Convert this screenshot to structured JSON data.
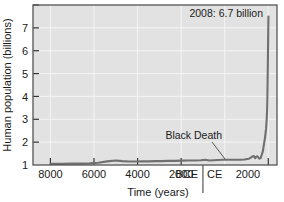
{
  "figure": {
    "background_color": "#ffffff",
    "plot_background_color": "#e2e2e2",
    "plot_border_color": "#555555",
    "gridline_color": "#f2f2f2",
    "line_color": "#707070",
    "text_color": "#1a1a1a"
  },
  "chart_data": {
    "type": "line",
    "title": "",
    "xlabel": "Time (years)",
    "ylabel": "Human population (billions)",
    "xlim": [
      -8800,
      2400
    ],
    "ylim": [
      0,
      7
    ],
    "grid": true,
    "legend": null,
    "x_tick_labels": [
      "8000",
      "6000",
      "4000",
      "2000",
      "BCE",
      "CE",
      "2000"
    ],
    "x_tick_values": [
      -8000,
      -6000,
      -4000,
      -2000,
      -350,
      350,
      2000
    ],
    "y_tick_labels": [
      "1",
      "2",
      "3",
      "4",
      "5",
      "6",
      "7"
    ],
    "y_tick_values": [
      1,
      2,
      3,
      4,
      5,
      6,
      7
    ],
    "era_divider_value": 0,
    "series": [
      {
        "name": "Human population",
        "x": [
          -8000,
          -7500,
          -7000,
          -6600,
          -6200,
          -5800,
          -5400,
          -5000,
          -4700,
          -4400,
          -4100,
          -3800,
          -3500,
          -3200,
          -2900,
          -2600,
          -2300,
          -2000,
          -1700,
          -1400,
          -1100,
          -900,
          -700,
          -500,
          -300,
          -100,
          100,
          300,
          500,
          700,
          900,
          1100,
          1250,
          1300,
          1340,
          1400,
          1450,
          1500,
          1550,
          1600,
          1650,
          1700,
          1750,
          1800,
          1850,
          1900,
          1927,
          1950,
          1960,
          1974,
          1987,
          1999,
          2008
        ],
        "y": [
          0.05,
          0.05,
          0.06,
          0.06,
          0.07,
          0.1,
          0.16,
          0.2,
          0.17,
          0.15,
          0.15,
          0.16,
          0.16,
          0.17,
          0.17,
          0.18,
          0.18,
          0.19,
          0.2,
          0.2,
          0.21,
          0.23,
          0.2,
          0.21,
          0.22,
          0.23,
          0.23,
          0.23,
          0.23,
          0.23,
          0.24,
          0.27,
          0.36,
          0.38,
          0.39,
          0.3,
          0.36,
          0.38,
          0.32,
          0.28,
          0.3,
          0.45,
          0.6,
          0.9,
          1.2,
          1.6,
          2.0,
          2.5,
          3.0,
          4.0,
          5.0,
          6.0,
          6.5
        ]
      }
    ],
    "annotations": [
      {
        "name": "population-2008-annotation",
        "text": "2008: 6.7 billion",
        "x": 2008,
        "y": 6.7
      },
      {
        "name": "black-death-annotation",
        "text": "Black Death",
        "x": 1348,
        "y": 0.37
      }
    ]
  }
}
